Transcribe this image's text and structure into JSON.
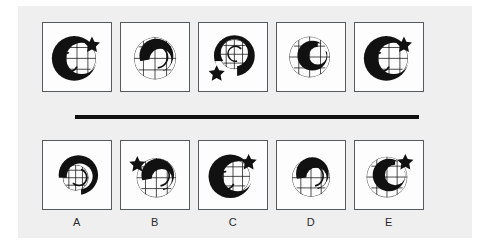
{
  "puzzle": {
    "type": "non-verbal-reasoning-matrix",
    "title": "",
    "divider_label": "",
    "colors": {
      "page_background": "#ffffff",
      "paper_background": "#efefef",
      "panel_background": "#fdfdfd",
      "panel_border": "#555a5e",
      "ink": "#111111",
      "label_text": "#2a2a2a"
    },
    "question_row": {
      "name": "question-sequence",
      "count": 5,
      "items": [
        {
          "index": 1,
          "label": "",
          "figure_name": "crescent-grid-star-figure",
          "description": "thick black C-shaped crescent opening right, fine grid sphere inside, small black five-point star upper right, small inner crescent arc",
          "crescent_rotation_deg": 0,
          "star": true,
          "star_position": "upper-right",
          "grid": true,
          "inner_arc": true
        },
        {
          "index": 2,
          "label": "",
          "figure_name": "crescent-grid-figure",
          "description": "black crescent opening lower-left rotated, full fine grid sphere behind, no star",
          "crescent_rotation_deg": 135,
          "star": false,
          "star_position": "",
          "grid": true,
          "inner_arc": true
        },
        {
          "index": 3,
          "label": "",
          "figure_name": "crescent-grid-star-figure",
          "description": "black crescent opening lower-right, grid patch inside, small black star at lower left outside",
          "crescent_rotation_deg": 215,
          "star": true,
          "star_position": "lower-left",
          "grid": true,
          "inner_arc": true
        },
        {
          "index": 4,
          "label": "",
          "figure_name": "crescent-grid-figure",
          "description": "small black crescent opening right over large fine grid sphere, no star",
          "crescent_rotation_deg": 0,
          "star": false,
          "star_position": "",
          "grid": true,
          "inner_arc": false
        },
        {
          "index": 5,
          "label": "",
          "figure_name": "crescent-grid-star-figure",
          "description": "thick black C-shaped crescent opening right, grid inside, black star upper right",
          "crescent_rotation_deg": 0,
          "star": true,
          "star_position": "upper-right",
          "grid": true,
          "inner_arc": true
        }
      ]
    },
    "answer_row": {
      "name": "answer-options",
      "count": 5,
      "items": [
        {
          "index": 1,
          "label": "A",
          "figure_name": "crescent-grid-figure",
          "description": "black crescent opening lower-left, small grid patch inside, no star",
          "crescent_rotation_deg": 150,
          "star": false,
          "star_position": "",
          "grid": true,
          "inner_arc": true
        },
        {
          "index": 2,
          "label": "B",
          "figure_name": "crescent-grid-star-figure",
          "description": "black crescent opening lower-left on grid sphere, black star upper left",
          "crescent_rotation_deg": 135,
          "star": true,
          "star_position": "upper-left",
          "grid": true,
          "inner_arc": true
        },
        {
          "index": 3,
          "label": "C",
          "figure_name": "crescent-grid-star-figure",
          "description": "thick black crescent opening right, grid inside, black star upper right",
          "crescent_rotation_deg": 0,
          "star": true,
          "star_position": "upper-right",
          "grid": true,
          "inner_arc": true
        },
        {
          "index": 4,
          "label": "D",
          "figure_name": "crescent-grid-figure",
          "description": "black crescent opening lower-left over grid sphere, no star",
          "crescent_rotation_deg": 140,
          "star": false,
          "star_position": "",
          "grid": true,
          "inner_arc": true
        },
        {
          "index": 5,
          "label": "E",
          "figure_name": "crescent-grid-star-figure",
          "description": "black crescent opening right over large grid sphere, black star upper right",
          "crescent_rotation_deg": 0,
          "star": true,
          "star_position": "upper-right",
          "grid": true,
          "inner_arc": false
        }
      ]
    }
  }
}
